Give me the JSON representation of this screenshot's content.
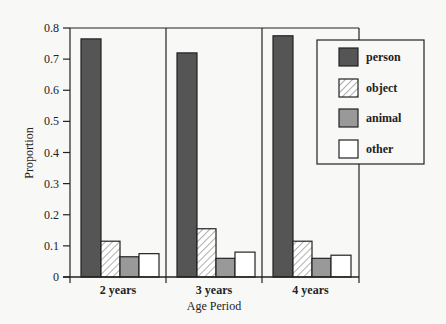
{
  "chart_data": {
    "type": "bar",
    "title": "",
    "xlabel": "Age Period",
    "ylabel": "Proportion",
    "ylim": [
      0,
      0.8
    ],
    "yticks": [
      0,
      0.1,
      0.2,
      0.3,
      0.4,
      0.5,
      0.6,
      0.7,
      0.8
    ],
    "ytick_labels": [
      "0",
      "0.1",
      "0.2",
      "0.3",
      "0.4",
      "0.5",
      "0.6",
      "0.7",
      "0.8"
    ],
    "categories": [
      "2 years",
      "3 years",
      "4 years"
    ],
    "series": [
      {
        "name": "person",
        "values": [
          0.765,
          0.72,
          0.775
        ],
        "fill": "#555555",
        "pattern": "solid"
      },
      {
        "name": "object",
        "values": [
          0.115,
          0.155,
          0.115
        ],
        "fill": "#ffffff",
        "pattern": "diagonal-hatch"
      },
      {
        "name": "animal",
        "values": [
          0.065,
          0.06,
          0.06
        ],
        "fill": "#999999",
        "pattern": "solid"
      },
      {
        "name": "other",
        "values": [
          0.075,
          0.08,
          0.07
        ],
        "fill": "#ffffff",
        "pattern": "solid"
      }
    ],
    "grid": false,
    "legend_position": "upper right (inside plot)"
  }
}
